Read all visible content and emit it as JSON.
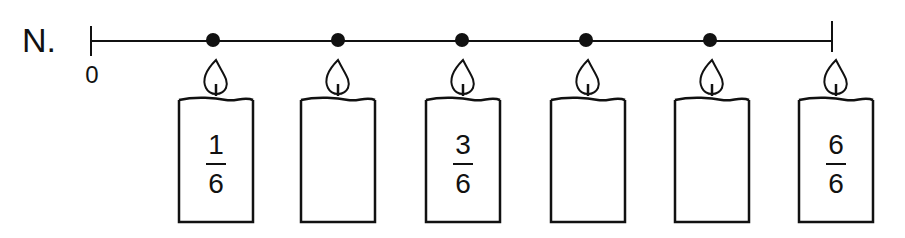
{
  "diagram": {
    "problem_label": "N.",
    "number_line": {
      "start_label": "0",
      "start_x": 91,
      "end_x": 832,
      "y": 41,
      "dots_x": [
        213,
        338,
        462,
        586,
        710
      ]
    },
    "candles": [
      {
        "x": 176,
        "numerator": "1",
        "denominator": "6",
        "filled": true
      },
      {
        "x": 298,
        "numerator": "",
        "denominator": "",
        "filled": false
      },
      {
        "x": 423,
        "numerator": "3",
        "denominator": "6",
        "filled": true
      },
      {
        "x": 548,
        "numerator": "",
        "denominator": "",
        "filled": false
      },
      {
        "x": 672,
        "numerator": "",
        "denominator": "",
        "filled": false
      },
      {
        "x": 796,
        "numerator": "6",
        "denominator": "6",
        "filled": true
      }
    ],
    "colors": {
      "ink": "#111111",
      "background": "#ffffff"
    }
  }
}
